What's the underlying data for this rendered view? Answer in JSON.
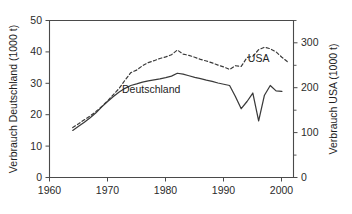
{
  "chart_data": {
    "type": "line",
    "title": "",
    "xlabel": "",
    "ylabel": "Verbrauch Deutschland (1000 t)",
    "y2label": "Verbrauch USA (1000 t)",
    "xlim": [
      1960,
      2002
    ],
    "ylim": [
      0,
      50
    ],
    "y2lim": [
      0,
      350
    ],
    "xticks": [
      1960,
      1970,
      1980,
      1990,
      2000
    ],
    "xticklabels": [
      "1960",
      "1970",
      "1980",
      "1990",
      "2000"
    ],
    "yticks": [
      0,
      10,
      20,
      30,
      40,
      50
    ],
    "yticklabels": [
      "0",
      "10",
      "20",
      "30",
      "40",
      "50"
    ],
    "y2ticks": [
      0,
      50,
      100,
      150,
      200,
      250,
      300,
      350
    ],
    "y2ticklabels_major": [
      "0",
      "100",
      "200",
      "300"
    ],
    "y2ticks_major": [
      0,
      100,
      200,
      300
    ],
    "y2ticks_minor": [
      50,
      150,
      250,
      350
    ],
    "grid": false,
    "legend_position": "inline-annotation",
    "annotations": [
      {
        "text": "Deutschland",
        "x": 1977.5,
        "y": 26.8,
        "axis": "left"
      },
      {
        "text": "USA",
        "x": 1996.0,
        "y": 36.9,
        "axis": "left"
      }
    ],
    "series": [
      {
        "name": "Deutschland",
        "axis": "left",
        "style": "solid",
        "unit": "1000 t",
        "x": [
          1964,
          1965,
          1966,
          1967,
          1968,
          1969,
          1970,
          1971,
          1972,
          1973,
          1974,
          1975,
          1976,
          1977,
          1978,
          1979,
          1980,
          1981,
          1982,
          1983,
          1984,
          1985,
          1986,
          1987,
          1988,
          1989,
          1990,
          1991,
          1992,
          1993,
          1994,
          1995,
          1996,
          1997,
          1998,
          1999,
          2000
        ],
        "values": [
          15.0,
          16.3,
          17.6,
          19.0,
          20.6,
          22.5,
          24.2,
          25.8,
          27.2,
          28.4,
          29.3,
          29.8,
          30.4,
          30.8,
          31.1,
          31.4,
          31.8,
          32.3,
          33.2,
          32.9,
          32.4,
          31.9,
          31.5,
          31.0,
          30.6,
          30.1,
          29.7,
          29.3,
          25.8,
          21.9,
          24.2,
          26.9,
          18.0,
          26.2,
          29.3,
          27.6,
          27.4
        ]
      },
      {
        "name": "USA",
        "axis": "right",
        "style": "dashed",
        "unit": "1000 t",
        "x": [
          1964,
          1965,
          1966,
          1967,
          1968,
          1969,
          1970,
          1971,
          1972,
          1973,
          1974,
          1975,
          1976,
          1977,
          1978,
          1979,
          1980,
          1981,
          1982,
          1983,
          1984,
          1985,
          1986,
          1987,
          1988,
          1989,
          1990,
          1991,
          1992,
          1993,
          1994,
          1995,
          1996,
          1997,
          1998,
          1999,
          2000,
          2001
        ],
        "values_left_scale": [
          15.9,
          17.1,
          18.4,
          19.6,
          21.0,
          22.6,
          24.4,
          26.4,
          28.4,
          31.0,
          33.4,
          34.2,
          35.6,
          36.6,
          37.2,
          37.9,
          38.4,
          39.1,
          40.6,
          39.3,
          38.9,
          38.3,
          37.6,
          37.1,
          36.5,
          35.8,
          35.2,
          34.4,
          35.6,
          35.4,
          38.2,
          38.6,
          40.7,
          41.5,
          41.0,
          40.0,
          38.3,
          36.8
        ],
        "values": [
          111,
          120,
          129,
          137,
          147,
          158,
          171,
          185,
          199,
          217,
          234,
          239,
          249,
          256,
          260,
          265,
          269,
          274,
          284,
          275,
          272,
          268,
          263,
          260,
          256,
          251,
          246,
          241,
          249,
          248,
          267,
          270,
          285,
          291,
          287,
          280,
          268,
          258
        ]
      }
    ]
  },
  "axes": {
    "left_title": "Verbrauch Deutschland (1000 t)",
    "right_title": "Verbrauch USA (1000 t)",
    "x_tick_1": "1960",
    "x_tick_2": "1970",
    "x_tick_3": "1980",
    "x_tick_4": "1990",
    "x_tick_5": "2000",
    "y_tick_0": "0",
    "y_tick_10": "10",
    "y_tick_20": "20",
    "y_tick_30": "30",
    "y_tick_40": "40",
    "y_tick_50": "50",
    "y2_tick_0": "0",
    "y2_tick_100": "100",
    "y2_tick_200": "200",
    "y2_tick_300": "300"
  },
  "labels": {
    "deutschland": "Deutschland",
    "usa": "USA"
  }
}
